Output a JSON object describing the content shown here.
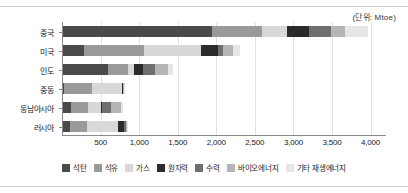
{
  "unit_note": "(단위: Mtoe)",
  "chart_data": {
    "type": "bar",
    "orientation": "horizontal",
    "stacked": true,
    "title": "",
    "subtitle": "",
    "xlabel": "",
    "ylabel": "",
    "unit": "Mtoe",
    "grid": true,
    "legend_position": "bottom",
    "xlim": [
      0,
      4200
    ],
    "xticks": [
      500,
      1000,
      1500,
      2000,
      2500,
      3000,
      3500,
      4000
    ],
    "xtick_labels": [
      "500",
      "1,000",
      "1,500",
      "2,000",
      "2,500",
      "3,000",
      "3,500",
      "4,000"
    ],
    "categories": [
      "중국",
      "미국",
      "인도",
      "중동",
      "동남아시아",
      "러시아"
    ],
    "series": [
      {
        "name": "석탄",
        "color": "#4a4a4a",
        "values": [
          1950,
          280,
          590,
          20,
          120,
          110
        ]
      },
      {
        "name": "석유",
        "color": "#9a9a9a",
        "values": [
          640,
          780,
          270,
          370,
          220,
          220
        ]
      },
      {
        "name": "가스",
        "color": "#d8d8d8",
        "values": [
          330,
          740,
          70,
          390,
          170,
          390
        ]
      },
      {
        "name": "원자력",
        "color": "#2b2b2b",
        "values": [
          280,
          220,
          120,
          10,
          10,
          90
        ]
      },
      {
        "name": "수력",
        "color": "#6f6f6f",
        "values": [
          290,
          70,
          150,
          5,
          110,
          20
        ]
      },
      {
        "name": "바이오에너지",
        "color": "#b5b5b5",
        "values": [
          180,
          130,
          180,
          5,
          130,
          15
        ]
      },
      {
        "name": "기타 재생에너지",
        "color": "#e6e6e6",
        "values": [
          300,
          90,
          60,
          5,
          30,
          10
        ]
      }
    ],
    "totals": [
      3970,
      2310,
      1440,
      805,
      790,
      855
    ]
  }
}
